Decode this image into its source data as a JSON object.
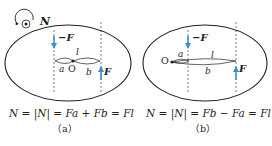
{
  "colors": {
    "ink": "#231f20",
    "arrow": "#3a8fd0",
    "background": "#ffffff"
  },
  "torque_indicator": {
    "icon": "circular-arrow-with-out-of-page-dot",
    "label": "N"
  },
  "panels": [
    {
      "id": "a",
      "force_top_label": "−F",
      "force_bottom_label": "F",
      "arm_total_label": "l",
      "arm_a_label": "a",
      "arm_b_label": "b",
      "pivot_label": "O",
      "equation": "N = |N| = Fa + Fb = Fl",
      "caption": "（a）"
    },
    {
      "id": "b",
      "force_top_label": "−F",
      "force_bottom_label": "F",
      "arm_total_label": "l",
      "arm_a_label": "a",
      "arm_b_label": "b",
      "pivot_label": "O",
      "equation": "N = |N| = Fb − Fa = Fl",
      "caption": "（b）"
    }
  ]
}
